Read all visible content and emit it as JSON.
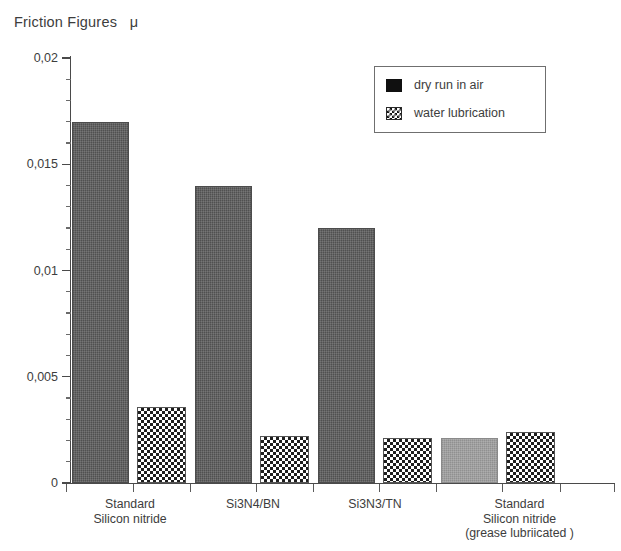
{
  "title": "Friction Figures   μ",
  "legend": {
    "position": "top-right",
    "entries": [
      {
        "label": "dry run in air",
        "swatch": "solid-black-square-icon"
      },
      {
        "label": "water lubrication",
        "swatch": "checkerboard-square-icon"
      }
    ]
  },
  "axis": {
    "y_ticks": [
      "0",
      "0,005",
      "0,01",
      "0,015",
      "0,02"
    ],
    "y_tick_values": [
      0,
      0.005,
      0.01,
      0.015,
      0.02
    ],
    "y_minor_step": 0.001,
    "ymin": 0,
    "ymax": 0.02
  },
  "chart_data": {
    "type": "bar",
    "title": "Friction Figures   μ",
    "xlabel": "",
    "ylabel": "",
    "ylim": [
      0,
      0.02
    ],
    "grid": false,
    "legend_position": "top-right",
    "categories": [
      "Standard\nSilicon nitride",
      "Si3N4/BN",
      "Si3N3/TN",
      "Standard\nSilicon nitride\n(grease lubriicated )"
    ],
    "series": [
      {
        "name": "dry run in air",
        "values": [
          0.017,
          0.014,
          0.012,
          0.0021
        ],
        "fill": "dark-textured",
        "color": "#5b5b5b"
      },
      {
        "name": "water lubrication",
        "values": [
          0.0036,
          0.0022,
          0.0021,
          0.0024
        ],
        "fill": "checkerboard",
        "color": "#ffffff"
      }
    ],
    "bars": [
      {
        "category": 0,
        "series": "dry run in air",
        "value": 0.017,
        "fill": "dark"
      },
      {
        "category": 0,
        "series": "water lubrication",
        "value": 0.0036,
        "fill": "checker"
      },
      {
        "category": 1,
        "series": "dry run in air",
        "value": 0.014,
        "fill": "dark"
      },
      {
        "category": 1,
        "series": "water lubrication",
        "value": 0.0022,
        "fill": "checker"
      },
      {
        "category": 2,
        "series": "dry run in air",
        "value": 0.012,
        "fill": "dark"
      },
      {
        "category": 2,
        "series": "water lubrication",
        "value": 0.0021,
        "fill": "checker"
      },
      {
        "category": 3,
        "series": "dry run in air",
        "value": 0.0021,
        "fill": "grey"
      },
      {
        "category": 3,
        "series": "water lubrication",
        "value": 0.0024,
        "fill": "checker"
      }
    ],
    "annotations": []
  },
  "colors": {
    "dark_bar": "#5b5b5b",
    "grey_bar": "#9b9b9b",
    "checker_bar": "#ffffff",
    "axis": "#4a4a4a",
    "text": "#3d3d3d",
    "background": "#ffffff"
  }
}
